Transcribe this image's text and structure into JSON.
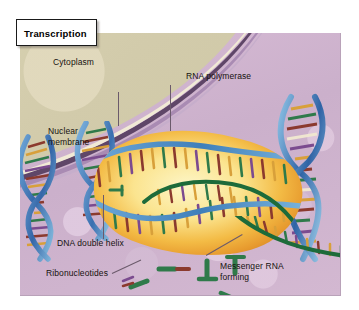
{
  "figure": {
    "title": "Transcription",
    "panel_background_color": "#cdb4cd",
    "cytoplasm_color": "#d5cead",
    "nuclear_membrane_color": "#5f4668",
    "polymerase_color": "#f0c14b",
    "dna_backbone_color": "#3f74b5",
    "mrna_color": "#1d6b3a"
  },
  "labels": [
    {
      "id": "cytoplasm",
      "text": "Cytoplasm"
    },
    {
      "id": "nuclear-membrane",
      "text": "Nuclear\nmembrane"
    },
    {
      "id": "rna-polymerase",
      "text": "RNA polymerase"
    },
    {
      "id": "dna-double-helix",
      "text": "DNA double helix"
    },
    {
      "id": "ribonucleotides",
      "text": "Ribonucleotides"
    },
    {
      "id": "messenger-rna",
      "text": "Messenger RNA\nforming"
    }
  ]
}
